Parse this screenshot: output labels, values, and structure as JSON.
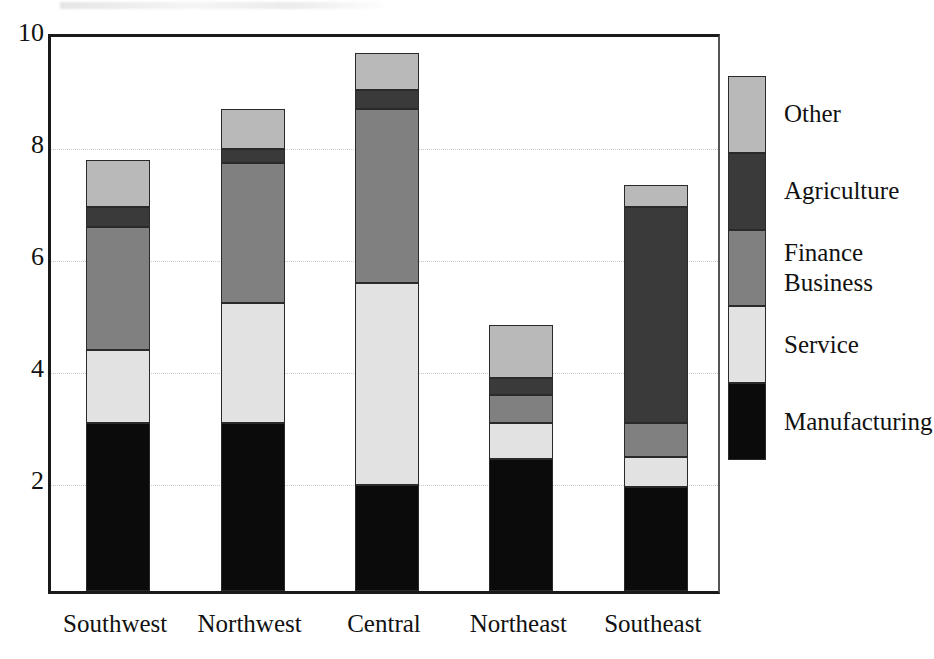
{
  "chart_data": {
    "type": "bar",
    "subtype": "stacked-bar",
    "title": "",
    "xlabel": "",
    "ylabel": "",
    "ylim": [
      0,
      10
    ],
    "yticks": [
      2,
      4,
      6,
      8,
      10
    ],
    "ytick_labels": [
      "2",
      "4",
      "6",
      "8",
      "10"
    ],
    "grid": true,
    "grid_axis": "y",
    "legend_position": "right",
    "categories": [
      "Southwest",
      "Northwest",
      "Central",
      "Northeast",
      "Southeast"
    ],
    "series": [
      {
        "name": "Manufacturing",
        "color": "#0b0b0b",
        "values": [
          3.0,
          3.0,
          1.9,
          2.35,
          1.85
        ]
      },
      {
        "name": "Service",
        "color": "#e2e2e2",
        "values": [
          1.3,
          2.15,
          3.6,
          0.65,
          0.55
        ]
      },
      {
        "name": "Finance\nBusiness",
        "color": "#808080",
        "values": [
          2.2,
          2.5,
          3.1,
          0.5,
          0.6
        ]
      },
      {
        "name": "Agriculture",
        "color": "#3a3a3a",
        "values": [
          0.35,
          0.25,
          0.35,
          0.3,
          3.85
        ]
      },
      {
        "name": "Other",
        "color": "#b9b9b9",
        "values": [
          0.85,
          0.7,
          0.65,
          0.95,
          0.4
        ]
      }
    ],
    "totals": [
      7.7,
      8.6,
      9.6,
      4.75,
      7.25
    ]
  },
  "legend": {
    "items": [
      {
        "label": "Other",
        "color": "#b9b9b9"
      },
      {
        "label": "Agriculture",
        "color": "#3a3a3a"
      },
      {
        "label": "Finance\nBusiness",
        "color": "#808080"
      },
      {
        "label": "Service",
        "color": "#e2e2e2"
      },
      {
        "label": "Manufacturing",
        "color": "#0b0b0b"
      }
    ]
  }
}
